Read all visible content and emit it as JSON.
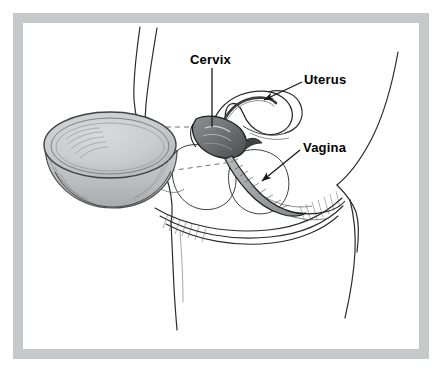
{
  "figure": {
    "kind": "medical-illustration",
    "frame_color": "#c6c8ca",
    "background_color": "#ffffff",
    "ink_color": "#1a1a1a",
    "diaphragm_fill": "#c8c9cb",
    "diaphragm_rim": "#8f9193"
  },
  "labels": [
    {
      "id": "cervix",
      "text": "Cervix",
      "leader": "vertical-line"
    },
    {
      "id": "uterus",
      "text": "Uterus",
      "leader": "arrow"
    },
    {
      "id": "vagina",
      "text": "Vagina",
      "leader": "arrow"
    }
  ],
  "icons": {
    "diaphragm": "diaphragm-cup-icon",
    "uterus": "uterus-icon",
    "cervix": "cervix-icon",
    "vagina": "vagina-icon"
  }
}
